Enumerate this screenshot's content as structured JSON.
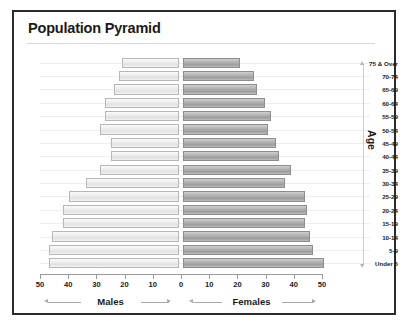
{
  "chart": {
    "title": "Population Pyramid",
    "age_axis_title": "Age",
    "male_caption": "Males",
    "female_caption": "Females"
  },
  "chart_data": {
    "type": "bar",
    "subtype": "population-pyramid",
    "title": "Population Pyramid",
    "xlabel": "",
    "ylabel": "Age",
    "orientation": "horizontal",
    "grid": true,
    "legend_position": "below-axis",
    "xlim": [
      -50,
      50
    ],
    "xticks": [
      50,
      40,
      30,
      20,
      10,
      0,
      10,
      20,
      30,
      40,
      50
    ],
    "xtick_labels": [
      "50",
      "40",
      "30",
      "20",
      "10",
      "0",
      "10",
      "20",
      "30",
      "40",
      "50"
    ],
    "categories": [
      "75 & Over",
      "70-74",
      "65-69",
      "60-64",
      "55-59",
      "50-54",
      "45-49",
      "40-44",
      "35-39",
      "30-34",
      "25-29",
      "20-24",
      "15-19",
      "10-14",
      "5-9",
      "Under 5"
    ],
    "series": [
      {
        "name": "Males",
        "side": "left",
        "color": "#e8e8e8",
        "values": [
          20,
          21,
          23,
          26,
          26,
          28,
          24,
          24,
          28,
          33,
          39,
          41,
          41,
          45,
          46,
          46
        ]
      },
      {
        "name": "Females",
        "side": "right",
        "color": "#a9a9a9",
        "values": [
          20,
          25,
          26,
          29,
          31,
          30,
          33,
          34,
          38,
          36,
          43,
          44,
          43,
          45,
          46,
          50
        ]
      }
    ]
  }
}
